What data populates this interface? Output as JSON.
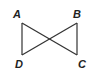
{
  "diagram": {
    "type": "bowtie-figure",
    "colors": {
      "stroke": "#333333",
      "label": "#222222",
      "background": "#ffffff"
    },
    "points": [
      {
        "name": "A",
        "x": 22,
        "y": 23,
        "label_x": 13,
        "label_y": 18
      },
      {
        "name": "B",
        "x": 77,
        "y": 23,
        "label_x": 73,
        "label_y": 18
      },
      {
        "name": "C",
        "x": 77,
        "y": 55,
        "label_x": 78,
        "label_y": 68
      },
      {
        "name": "D",
        "x": 22,
        "y": 55,
        "label_x": 15,
        "label_y": 68
      }
    ],
    "segments": [
      "AD",
      "BC",
      "AC",
      "BD"
    ],
    "labels": {
      "A": "A",
      "B": "B",
      "C": "C",
      "D": "D"
    }
  }
}
